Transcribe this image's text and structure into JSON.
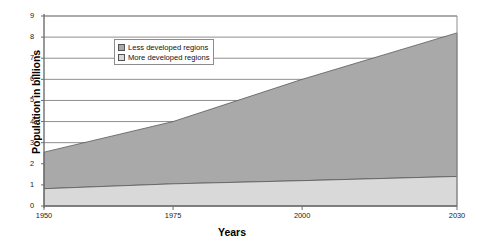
{
  "chart_data": {
    "type": "area",
    "title": "",
    "subtitle": "",
    "xlabel": "Years",
    "ylabel": "Population in billions",
    "stacked": true,
    "grid": true,
    "legend_position": "upper-left-inside",
    "xlim": [
      1950,
      2030
    ],
    "ylim": [
      0,
      9
    ],
    "x": [
      1950,
      1975,
      2000,
      2030
    ],
    "xticks": [
      1950,
      1975,
      2000,
      2030
    ],
    "xtick_labels": [
      "1950",
      "1975",
      "2000",
      "2030"
    ],
    "yticks": [
      0,
      1,
      2,
      3,
      4,
      5,
      6,
      7,
      8,
      9
    ],
    "ytick_labels": [
      "0",
      "1",
      "2",
      "3",
      "4",
      "5",
      "6",
      "7",
      "8",
      "9"
    ],
    "series": [
      {
        "name": "More developed regions",
        "values": [
          0.82,
          1.05,
          1.2,
          1.4
        ],
        "color": "#d9d9d9"
      },
      {
        "name": "Less developed regions",
        "values": [
          1.73,
          2.95,
          4.8,
          6.8
        ],
        "color": "#a9a9a9"
      }
    ],
    "stack_totals": [
      2.55,
      4.0,
      6.0,
      8.2
    ],
    "annotations": []
  },
  "legend": {
    "items": [
      {
        "label": "Less developed regions",
        "color": "#a9a9a9"
      },
      {
        "label": "More developed regions",
        "color": "#d9d9d9"
      }
    ]
  },
  "colors": {
    "less_developed": "#a9a9a9",
    "more_developed": "#d9d9d9",
    "axis": "#6e6e6e",
    "gridline": "#8f8f8f",
    "text": "#000000",
    "background": "#ffffff"
  }
}
